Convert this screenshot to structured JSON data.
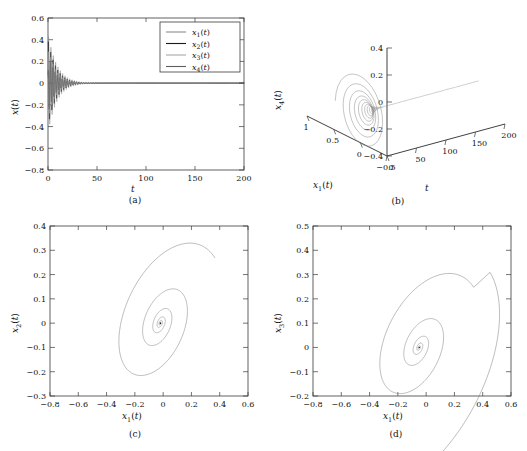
{
  "figure": {
    "background": "#ffffff",
    "panel_count": 4
  },
  "chart_data": [
    {
      "type": "line",
      "panel": "a",
      "caption": "(a)",
      "title": "",
      "xlabel": "t",
      "ylabel": "x(t)",
      "xlim": [
        0,
        200
      ],
      "ylim": [
        -0.8,
        0.6
      ],
      "xticks": [
        "0",
        "50",
        "100",
        "150",
        "200"
      ],
      "xtick_values": [
        0,
        50,
        100,
        150,
        200
      ],
      "yticks": [
        "0.6",
        "0.4",
        "0.2",
        "0",
        "-0.2",
        "-0.4",
        "-0.6",
        "-0.8"
      ],
      "ytick_values": [
        0.6,
        0.4,
        0.2,
        0,
        -0.2,
        -0.4,
        -0.6,
        -0.8
      ],
      "grid": false,
      "legend_position": "upper-right",
      "legend": [
        "x1(t)",
        "x2(t)",
        "x3(t)",
        "x4(t)"
      ],
      "series": [
        {
          "name": "x1(t)",
          "color": "#8d8d8d",
          "amplitude": 0.46,
          "decay": 0.11,
          "period": 2.4,
          "phase": 0.0
        },
        {
          "name": "x2(t)",
          "color": "#1a1a1a",
          "amplitude": 0.4,
          "decay": 0.12,
          "period": 2.4,
          "phase": 0.6
        },
        {
          "name": "x3(t)",
          "color": "#a8a8a8",
          "amplitude": 0.33,
          "decay": 0.13,
          "period": 2.4,
          "phase": 1.2
        },
        {
          "name": "x4(t)",
          "color": "#5e5e5e",
          "amplitude": 0.28,
          "decay": 0.14,
          "period": 2.4,
          "phase": 1.9
        }
      ],
      "description": "Damped oscillations of all four states decaying to zero by about t = 60"
    },
    {
      "type": "line",
      "panel": "b",
      "caption": "(b)",
      "projection": "3d",
      "xlabel": "x1(t)",
      "ylabel": "t",
      "zlabel": "x4(t)",
      "xlim": [
        -0.5,
        1
      ],
      "ylim": [
        0,
        200
      ],
      "zlim": [
        -0.4,
        0.4
      ],
      "xticks": [
        "1",
        "0.5",
        "0",
        "-0.5"
      ],
      "xtick_values": [
        1,
        0.5,
        0,
        -0.5
      ],
      "yticks": [
        "0",
        "50",
        "100",
        "150",
        "200"
      ],
      "ytick_values": [
        0,
        50,
        100,
        150,
        200
      ],
      "zticks": [
        "0.4",
        "0.2",
        "0",
        "-0.2",
        "-0.4"
      ],
      "ztick_values": [
        0.4,
        0.2,
        0,
        -0.2,
        -0.4
      ],
      "grid": false,
      "color": "#8a8a8a",
      "description": "Three dimensional spiral trajectory in x1-t-x4 space converging to a fixed point then a straight line along increasing t"
    },
    {
      "type": "line",
      "panel": "c",
      "caption": "(c)",
      "xlabel": "x1(t)",
      "ylabel": "x2(t)",
      "xlim": [
        -0.8,
        0.6
      ],
      "ylim": [
        -0.3,
        0.4
      ],
      "xticks": [
        "-0.8",
        "-0.6",
        "-0.4",
        "-0.2",
        "0",
        "0.2",
        "0.4",
        "0.6"
      ],
      "xtick_values": [
        -0.8,
        -0.6,
        -0.4,
        -0.2,
        0,
        0.2,
        0.4,
        0.6
      ],
      "yticks": [
        "0.4",
        "0.3",
        "0.2",
        "0.1",
        "0",
        "-0.1",
        "-0.2",
        "-0.3"
      ],
      "ytick_values": [
        0.4,
        0.3,
        0.2,
        0.1,
        0,
        -0.1,
        -0.2,
        -0.3
      ],
      "grid": false,
      "color": "#7b7b7b",
      "spiral": {
        "r0": 0.47,
        "decay": 0.135,
        "turns": 9.5,
        "tilt_deg": 35,
        "aspect": 0.62,
        "cx": -0.02,
        "cy": 0.0
      },
      "description": "Tilted elliptical phase portrait spiralling inward to the origin"
    },
    {
      "type": "line",
      "panel": "d",
      "caption": "(d)",
      "xlabel": "x1(t)",
      "ylabel": "x3(t)",
      "xlim": [
        -0.8,
        0.6
      ],
      "ylim": [
        -0.2,
        0.5
      ],
      "xticks": [
        "-0.8",
        "-0.6",
        "-0.4",
        "-0.2",
        "0",
        "0.2",
        "0.4",
        "0.6"
      ],
      "xtick_values": [
        -0.8,
        -0.6,
        -0.4,
        -0.2,
        0,
        0.2,
        0.4,
        0.6
      ],
      "yticks": [
        "0.5",
        "0.4",
        "0.3",
        "0.2",
        "0.1",
        "0",
        "-0.1",
        "-0.2"
      ],
      "ytick_values": [
        0.5,
        0.4,
        0.3,
        0.2,
        0.1,
        0,
        -0.1,
        -0.2
      ],
      "grid": false,
      "color": "#7b7b7b",
      "spiral": {
        "r0": 0.46,
        "decay": 0.15,
        "turns": 9.5,
        "tilt_deg": 32,
        "aspect": 0.6,
        "cx": -0.05,
        "cy": 0.0
      },
      "start_point": [
        0.5,
        0.33
      ],
      "description": "Phase portrait x1 versus x3 with a wide first loop reaching 0.4 then spiralling inward to the origin"
    }
  ]
}
